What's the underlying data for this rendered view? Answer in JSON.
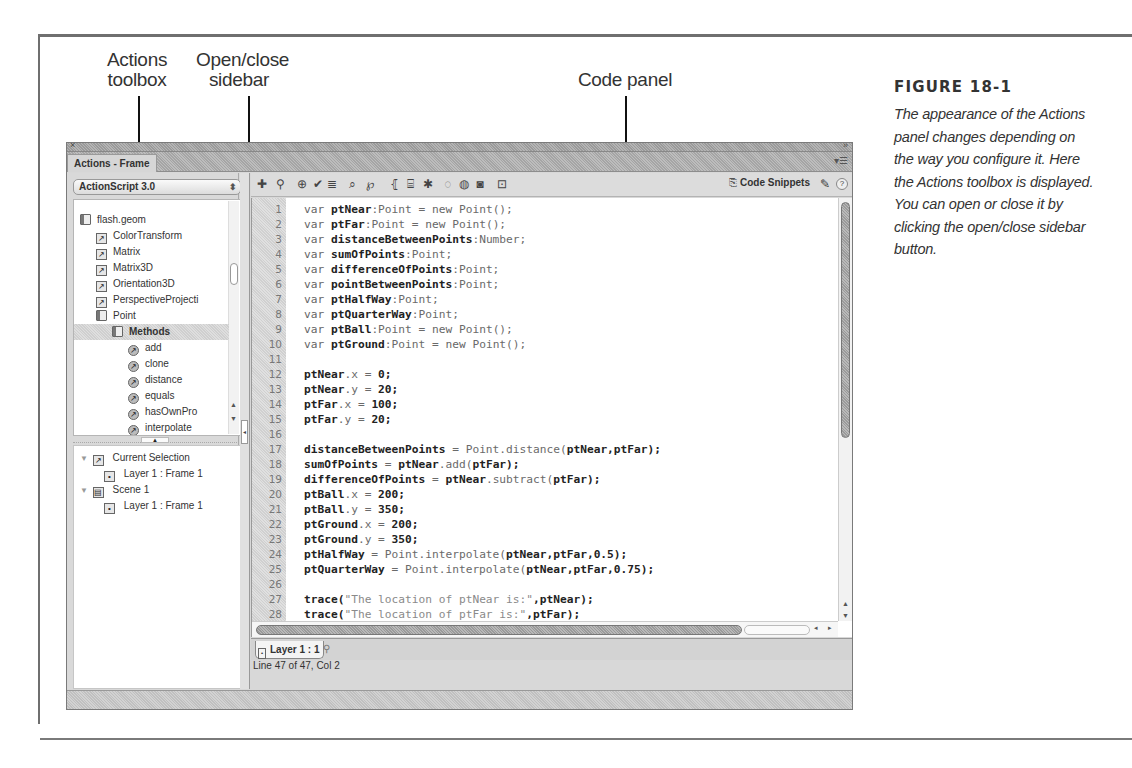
{
  "callouts": {
    "actions_toolbox": "Actions\ntoolbox",
    "open_close_sidebar": "Open/close\nsidebar",
    "code_panel": "Code panel"
  },
  "caption": {
    "title": "FIGURE 18-1",
    "body": "The appearance of the Actions panel changes depending on the way you configure it. Here the Actions toolbox is displayed. You can open or close it by clicking the open/close sidebar button."
  },
  "panel": {
    "tab_label": "Actions - Frame",
    "language_select": "ActionScript 3.0",
    "toolbox_tree": [
      {
        "label": "flash.geom",
        "icon": "package-book-icon",
        "indent": 0,
        "y": 12
      },
      {
        "label": "ColorTransform",
        "icon": "class-icon",
        "indent": 1,
        "y": 28
      },
      {
        "label": "Matrix",
        "icon": "class-icon",
        "indent": 1,
        "y": 44
      },
      {
        "label": "Matrix3D",
        "icon": "class-icon",
        "indent": 1,
        "y": 60
      },
      {
        "label": "Orientation3D",
        "icon": "class-icon",
        "indent": 1,
        "y": 76
      },
      {
        "label": "PerspectiveProjecti",
        "icon": "class-icon",
        "indent": 1,
        "y": 92
      },
      {
        "label": "Point",
        "icon": "package-book-icon",
        "indent": 1,
        "y": 108
      },
      {
        "label": "Methods",
        "icon": "package-book-icon",
        "indent": 2,
        "y": 124,
        "selected": true
      },
      {
        "label": "add",
        "icon": "method-icon",
        "indent": 3,
        "y": 140
      },
      {
        "label": "clone",
        "icon": "method-icon",
        "indent": 3,
        "y": 156
      },
      {
        "label": "distance",
        "icon": "method-icon",
        "indent": 3,
        "y": 172
      },
      {
        "label": "equals",
        "icon": "method-icon",
        "indent": 3,
        "y": 188
      },
      {
        "label": "hasOwnPro",
        "icon": "method-icon",
        "indent": 3,
        "y": 204
      },
      {
        "label": "interpolate",
        "icon": "method-icon",
        "indent": 3,
        "y": 220
      }
    ],
    "script_navigator": [
      {
        "label": "Current Selection",
        "icon": "class-icon",
        "disclosure": true
      },
      {
        "label": "Layer 1 : Frame 1",
        "icon": "frame-icon",
        "disclosure": false
      },
      {
        "label": "Scene 1",
        "icon": "scene-clapper-icon",
        "disclosure": true
      },
      {
        "label": "Layer 1 : Frame 1",
        "icon": "frame-icon",
        "disclosure": false
      }
    ],
    "toolbar": {
      "icons": [
        "add-statement-icon",
        "find-icon",
        "insert-target-path-icon",
        "check-syntax-icon",
        "auto-format-icon",
        "show-code-hint-icon",
        "debug-options-icon",
        "collapse-between-braces-icon",
        "collapse-selection-icon",
        "expand-all-icon",
        "apply-block-comment-icon",
        "apply-line-comment-icon",
        "remove-comment-icon",
        "show-hide-toolbox-icon"
      ],
      "code_snippets_label": "Code Snippets"
    },
    "code_lines": [
      {
        "n": "1",
        "tokens": [
          [
            "kw",
            "var "
          ],
          [
            "ident",
            "ptNear"
          ],
          [
            "type",
            ":Point = "
          ],
          [
            "kw",
            "new "
          ],
          [
            "type",
            "Point();"
          ]
        ]
      },
      {
        "n": "2",
        "tokens": [
          [
            "kw",
            "var "
          ],
          [
            "ident",
            "ptFar"
          ],
          [
            "type",
            ":Point = "
          ],
          [
            "kw",
            "new "
          ],
          [
            "type",
            "Point();"
          ]
        ]
      },
      {
        "n": "3",
        "tokens": [
          [
            "kw",
            "var "
          ],
          [
            "ident",
            "distanceBetweenPoints"
          ],
          [
            "type",
            ":Number;"
          ]
        ]
      },
      {
        "n": "4",
        "tokens": [
          [
            "kw",
            "var "
          ],
          [
            "ident",
            "sumOfPoints"
          ],
          [
            "type",
            ":Point;"
          ]
        ]
      },
      {
        "n": "5",
        "tokens": [
          [
            "kw",
            "var "
          ],
          [
            "ident",
            "differenceOfPoints"
          ],
          [
            "type",
            ":Point;"
          ]
        ]
      },
      {
        "n": "6",
        "tokens": [
          [
            "kw",
            "var "
          ],
          [
            "ident",
            "pointBetweenPoints"
          ],
          [
            "type",
            ":Point;"
          ]
        ]
      },
      {
        "n": "7",
        "tokens": [
          [
            "kw",
            "var "
          ],
          [
            "ident",
            "ptHalfWay"
          ],
          [
            "type",
            ":Point;"
          ]
        ]
      },
      {
        "n": "8",
        "tokens": [
          [
            "kw",
            "var "
          ],
          [
            "ident",
            "ptQuarterWay"
          ],
          [
            "type",
            ":Point;"
          ]
        ]
      },
      {
        "n": "9",
        "tokens": [
          [
            "kw",
            "var "
          ],
          [
            "ident",
            "ptBall"
          ],
          [
            "type",
            ":Point = "
          ],
          [
            "kw",
            "new "
          ],
          [
            "type",
            "Point();"
          ]
        ]
      },
      {
        "n": "10",
        "tokens": [
          [
            "kw",
            "var "
          ],
          [
            "ident",
            "ptGround"
          ],
          [
            "type",
            ":Point = "
          ],
          [
            "kw",
            "new "
          ],
          [
            "type",
            "Point();"
          ]
        ]
      },
      {
        "n": "11",
        "tokens": []
      },
      {
        "n": "12",
        "tokens": [
          [
            "ident",
            "ptNear"
          ],
          [
            "type",
            ".x = "
          ],
          [
            "ident",
            "0;"
          ]
        ]
      },
      {
        "n": "13",
        "tokens": [
          [
            "ident",
            "ptNear"
          ],
          [
            "type",
            ".y = "
          ],
          [
            "ident",
            "20;"
          ]
        ]
      },
      {
        "n": "14",
        "tokens": [
          [
            "ident",
            "ptFar"
          ],
          [
            "type",
            ".x = "
          ],
          [
            "ident",
            "100;"
          ]
        ]
      },
      {
        "n": "15",
        "tokens": [
          [
            "ident",
            "ptFar"
          ],
          [
            "type",
            ".y = "
          ],
          [
            "ident",
            "20;"
          ]
        ]
      },
      {
        "n": "16",
        "tokens": []
      },
      {
        "n": "17",
        "tokens": [
          [
            "ident",
            "distanceBetweenPoints"
          ],
          [
            "type",
            " = Point.distance("
          ],
          [
            "ident",
            "ptNear,ptFar);"
          ]
        ]
      },
      {
        "n": "18",
        "tokens": [
          [
            "ident",
            "sumOfPoints"
          ],
          [
            "type",
            " = "
          ],
          [
            "ident",
            "ptNear"
          ],
          [
            "type",
            ".add("
          ],
          [
            "ident",
            "ptFar);"
          ]
        ]
      },
      {
        "n": "19",
        "tokens": [
          [
            "ident",
            "differenceOfPoints"
          ],
          [
            "type",
            " = "
          ],
          [
            "ident",
            "ptNear"
          ],
          [
            "type",
            ".subtract("
          ],
          [
            "ident",
            "ptFar);"
          ]
        ]
      },
      {
        "n": "20",
        "tokens": [
          [
            "ident",
            "ptBall"
          ],
          [
            "type",
            ".x = "
          ],
          [
            "ident",
            "200;"
          ]
        ]
      },
      {
        "n": "21",
        "tokens": [
          [
            "ident",
            "ptBall"
          ],
          [
            "type",
            ".y = "
          ],
          [
            "ident",
            "350;"
          ]
        ]
      },
      {
        "n": "22",
        "tokens": [
          [
            "ident",
            "ptGround"
          ],
          [
            "type",
            ".x = "
          ],
          [
            "ident",
            "200;"
          ]
        ]
      },
      {
        "n": "23",
        "tokens": [
          [
            "ident",
            "ptGround"
          ],
          [
            "type",
            ".y = "
          ],
          [
            "ident",
            "350;"
          ]
        ]
      },
      {
        "n": "24",
        "tokens": [
          [
            "ident",
            "ptHalfWay"
          ],
          [
            "type",
            " = Point.interpolate("
          ],
          [
            "ident",
            "ptNear,ptFar,0.5);"
          ]
        ]
      },
      {
        "n": "25",
        "tokens": [
          [
            "ident",
            "ptQuarterWay"
          ],
          [
            "type",
            " = Point.interpolate("
          ],
          [
            "ident",
            "ptNear,ptFar,0.75);"
          ]
        ]
      },
      {
        "n": "26",
        "tokens": []
      },
      {
        "n": "27",
        "tokens": [
          [
            "ident",
            "trace("
          ],
          [
            "str",
            "\"The location of ptNear is:\""
          ],
          [
            "ident",
            ",ptNear);"
          ]
        ]
      },
      {
        "n": "28",
        "tokens": [
          [
            "ident",
            "trace("
          ],
          [
            "str",
            "\"The location of ptFar is:\""
          ],
          [
            "ident",
            ",ptFar);"
          ]
        ]
      },
      {
        "n": "29",
        "tokens": [
          [
            "ident",
            "trace("
          ],
          [
            "str",
            "..."
          ]
        ]
      }
    ],
    "script_tab_label": "Layer 1 : 1",
    "status": "Line 47 of 47, Col 2"
  }
}
